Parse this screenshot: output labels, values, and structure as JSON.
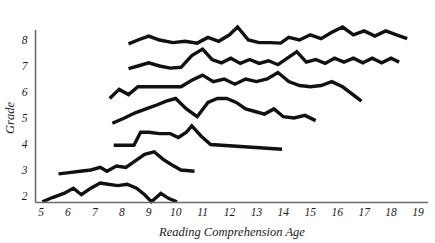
{
  "chart_data": {
    "type": "line",
    "title": "",
    "xlabel": "Reading Comprehension Age",
    "ylabel": "Grade",
    "xlim": [
      5,
      19
    ],
    "ylim": [
      1.75,
      8.6
    ],
    "grid": false,
    "legend": "none",
    "xticks": [
      5,
      6,
      7,
      8,
      9,
      10,
      11,
      12,
      13,
      14,
      15,
      16,
      17,
      18,
      19
    ],
    "xtick_labels": [
      "5",
      "6",
      "7",
      "8",
      "9",
      "10",
      "11",
      "12",
      "13",
      "14",
      "15",
      "16",
      "17",
      "18",
      "19"
    ],
    "yticks": [
      2,
      3,
      4,
      5,
      6,
      7,
      8
    ],
    "ytick_labels": [
      "2",
      "3",
      "4",
      "5",
      "6",
      "7",
      "8"
    ],
    "series": [
      {
        "name": "Grade 8",
        "x": [
          8.25,
          8.6,
          9.0,
          9.4,
          9.9,
          10.35,
          10.8,
          11.2,
          11.6,
          12.0,
          12.3,
          12.7,
          13.1,
          13.5,
          13.9,
          14.2,
          14.6,
          15.0,
          15.4,
          15.8,
          16.2,
          16.6,
          17.0,
          17.4,
          17.8,
          18.2,
          18.6
        ],
        "y": [
          7.85,
          8.0,
          8.15,
          8.0,
          7.9,
          7.95,
          7.88,
          8.1,
          7.95,
          8.2,
          8.5,
          8.0,
          7.9,
          7.9,
          7.88,
          8.1,
          8.0,
          8.2,
          8.05,
          8.3,
          8.5,
          8.2,
          8.35,
          8.15,
          8.35,
          8.2,
          8.05
        ]
      },
      {
        "name": "Grade 7",
        "x": [
          8.25,
          8.6,
          9.0,
          9.4,
          9.8,
          10.2,
          10.6,
          11.0,
          11.35,
          11.7,
          12.05,
          12.4,
          12.75,
          13.1,
          13.45,
          13.8,
          14.15,
          14.5,
          14.85,
          15.2,
          15.55,
          15.9,
          16.25,
          16.6,
          16.95,
          17.3,
          17.65,
          18.0,
          18.3
        ],
        "y": [
          6.9,
          7.0,
          7.12,
          7.0,
          6.92,
          6.95,
          7.4,
          7.65,
          7.25,
          7.12,
          7.3,
          7.1,
          7.25,
          7.1,
          7.2,
          7.05,
          7.3,
          7.55,
          7.15,
          7.25,
          7.1,
          7.3,
          7.15,
          7.3,
          7.12,
          7.3,
          7.12,
          7.3,
          7.15
        ]
      },
      {
        "name": "Grade 6",
        "x": [
          7.55,
          7.9,
          8.25,
          8.6,
          9.0,
          9.4,
          9.8,
          10.2,
          10.6,
          11.0,
          11.4,
          11.8,
          12.2,
          12.6,
          13.0,
          13.4,
          13.8,
          14.2,
          14.6,
          15.0,
          15.4,
          15.8,
          16.2,
          16.9
        ],
        "y": [
          5.75,
          6.1,
          5.9,
          6.2,
          6.2,
          6.2,
          6.2,
          6.2,
          6.45,
          6.65,
          6.4,
          6.5,
          6.3,
          6.5,
          6.4,
          6.5,
          6.75,
          6.4,
          6.25,
          6.2,
          6.25,
          6.4,
          6.2,
          5.65
        ]
      },
      {
        "name": "Grade 5",
        "x": [
          7.65,
          8.1,
          8.5,
          8.9,
          9.3,
          9.65,
          10.0,
          10.4,
          10.8,
          11.2,
          11.55,
          11.9,
          12.25,
          12.6,
          12.95,
          13.3,
          13.65,
          14.0,
          14.4,
          14.8,
          15.2
        ],
        "y": [
          4.8,
          5.0,
          5.2,
          5.35,
          5.5,
          5.65,
          5.75,
          5.35,
          5.05,
          5.6,
          5.75,
          5.75,
          5.6,
          5.35,
          5.25,
          5.15,
          5.35,
          5.05,
          5.0,
          5.1,
          4.9
        ]
      },
      {
        "name": "Grade 4",
        "x": [
          7.7,
          8.1,
          8.45,
          8.7,
          9.0,
          9.4,
          9.8,
          10.1,
          10.4,
          10.6,
          10.95,
          11.3,
          13.95
        ],
        "y": [
          3.95,
          3.95,
          3.95,
          4.45,
          4.45,
          4.4,
          4.4,
          4.25,
          4.45,
          4.7,
          4.3,
          3.98,
          3.8
        ]
      },
      {
        "name": "Grade 3",
        "x": [
          5.65,
          6.05,
          6.45,
          6.85,
          7.2,
          7.45,
          7.8,
          8.15,
          8.5,
          8.85,
          9.2,
          9.55,
          9.85,
          10.2,
          10.7
        ],
        "y": [
          2.85,
          2.9,
          2.95,
          3.0,
          3.1,
          2.95,
          3.15,
          3.1,
          3.35,
          3.6,
          3.7,
          3.4,
          3.2,
          3.0,
          2.95
        ]
      },
      {
        "name": "Grade 2",
        "x": [
          5.05,
          5.45,
          5.85,
          6.2,
          6.5,
          6.85,
          7.2,
          7.5,
          7.85,
          8.2,
          8.55,
          8.85,
          9.1,
          9.45,
          9.75,
          10.05
        ],
        "y": [
          1.78,
          1.95,
          2.1,
          2.3,
          2.05,
          2.3,
          2.5,
          2.45,
          2.4,
          2.45,
          2.3,
          2.05,
          1.78,
          2.1,
          1.9,
          1.78
        ]
      }
    ]
  }
}
